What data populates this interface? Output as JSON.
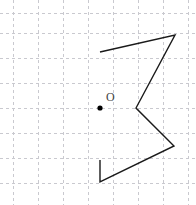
{
  "figure": {
    "width": 196,
    "height": 205,
    "background_color": "#ffffff"
  },
  "grid": {
    "color": "#c9c9cf",
    "style": "dashed",
    "spacing": 25,
    "origin_offset_x": 13,
    "origin_offset_y": 13,
    "vertical_lines_x": [
      13,
      38,
      63,
      88,
      113,
      138,
      163,
      188
    ],
    "horizontal_lines_y": [
      13,
      33,
      58,
      83,
      108,
      133,
      158,
      183
    ]
  },
  "shape": {
    "name": "open-polyline",
    "stroke_color": "#1a1a1a",
    "stroke_width": 1.4,
    "points": [
      [
        100,
        52
      ],
      [
        175,
        35
      ],
      [
        136,
        108
      ],
      [
        174,
        146
      ],
      [
        100,
        182
      ],
      [
        100,
        160
      ]
    ],
    "points_attr": "100,52 175,35 136,108 174,146 100,182 100,160"
  },
  "origin_point": {
    "label": "O",
    "dot_x": 100,
    "dot_y": 108,
    "dot_radius": 2.6,
    "dot_color": "#000000",
    "label_x": 106,
    "label_y": 101,
    "label_color": "#444444"
  }
}
